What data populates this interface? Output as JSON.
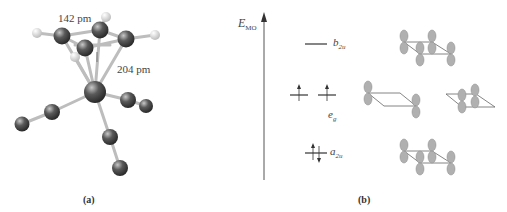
{
  "panel_a": {
    "caption": "(a)",
    "bond_label_cc": "142 pm",
    "bond_label_crc": "204 pm",
    "molecule": "benzene-chromium-tricarbonyl"
  },
  "panel_b": {
    "caption": "(b)",
    "axis_label": "E",
    "axis_label_sub": "MO",
    "levels": [
      {
        "name": "b",
        "sub": "2u",
        "electrons": 0
      },
      {
        "name": "e",
        "sub": "g",
        "electrons": 2,
        "degenerate": 2
      },
      {
        "name": "a",
        "sub": "2u",
        "electrons": 2
      }
    ]
  },
  "colors": {
    "atom_dark": "#4a4a4a",
    "atom_h": "#f2f2f2",
    "bond": "#c8c8c8",
    "orbital": "#a8a8a8",
    "line": "#555555"
  }
}
